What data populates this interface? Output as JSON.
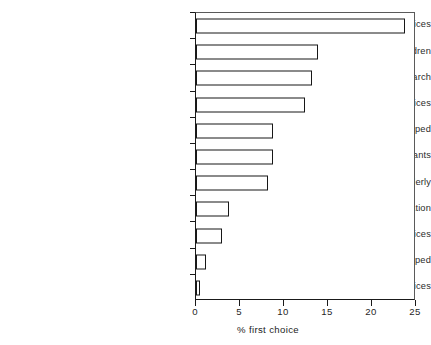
{
  "chart_data": {
    "type": "bar",
    "orientation": "horizontal",
    "title": "",
    "xlabel": "% first choice",
    "ylabel": "",
    "xlim": [
      0,
      25
    ],
    "ylim": null,
    "xticks": [
      0,
      5,
      10,
      15,
      20,
      25
    ],
    "xtick_labels": [
      "0",
      "5",
      "10",
      "15",
      "20",
      "25"
    ],
    "grid": false,
    "legend": null,
    "bar_style": {
      "fill": "#ffffff",
      "edge": "#171717",
      "edge_width": 1.6
    },
    "categories": [
      "general and acute hospital services",
      "services for children",
      "prevention and research",
      "primary care services",
      "services for the mentally ill/handicapped",
      "heart transplants",
      "services for the elderly",
      "health education",
      "maternity services",
      "services for physically handicapped",
      "other services"
    ],
    "values": [
      23.7,
      13.9,
      13.2,
      12.4,
      8.7,
      8.7,
      8.2,
      3.8,
      2.9,
      1.1,
      0.4
    ],
    "series": [
      {
        "name": "% first choice",
        "values": [
          23.7,
          13.9,
          13.2,
          12.4,
          8.7,
          8.7,
          8.2,
          3.8,
          2.9,
          1.1,
          0.4
        ]
      }
    ]
  },
  "axis": {
    "x_title": "% first choice"
  }
}
